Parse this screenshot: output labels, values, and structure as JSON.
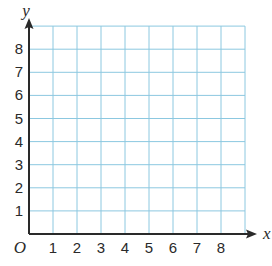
{
  "chart_data": {
    "type": "scatter",
    "title": "",
    "xlabel": "x",
    "ylabel": "y",
    "origin_label": "O",
    "xlim": [
      0,
      9
    ],
    "ylim": [
      0,
      9
    ],
    "x_ticks": [
      1,
      2,
      3,
      4,
      5,
      6,
      7,
      8
    ],
    "y_ticks": [
      1,
      2,
      3,
      4,
      5,
      6,
      7,
      8
    ],
    "grid": true,
    "grid_color": "#8cc8e0",
    "axis_color": "#2a2a2a",
    "series": [],
    "note": "Empty first-quadrant coordinate grid, 9x9 cells, no plotted points"
  }
}
